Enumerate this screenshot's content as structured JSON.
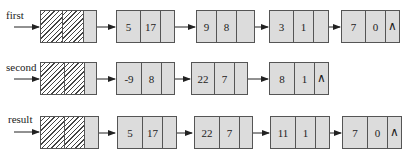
{
  "diagram": {
    "type": "linked-list-polynomial-addition",
    "null_symbol": "∧",
    "lists": [
      {
        "name": "first",
        "nodes": [
          {
            "coef": "5",
            "exp": "17"
          },
          {
            "coef": "9",
            "exp": "8"
          },
          {
            "coef": "3",
            "exp": "1"
          },
          {
            "coef": "7",
            "exp": "0"
          }
        ]
      },
      {
        "name": "second",
        "nodes": [
          {
            "coef": "-9",
            "exp": "8"
          },
          {
            "coef": "22",
            "exp": "7"
          },
          {
            "coef": "8",
            "exp": "1"
          }
        ]
      },
      {
        "name": "result",
        "nodes": [
          {
            "coef": "5",
            "exp": "17"
          },
          {
            "coef": "22",
            "exp": "7"
          },
          {
            "coef": "11",
            "exp": "1"
          },
          {
            "coef": "7",
            "exp": "0"
          }
        ]
      }
    ]
  },
  "colors": {
    "node_fill": "#dcdcdc",
    "border": "#555555",
    "arrow": "#222222"
  }
}
